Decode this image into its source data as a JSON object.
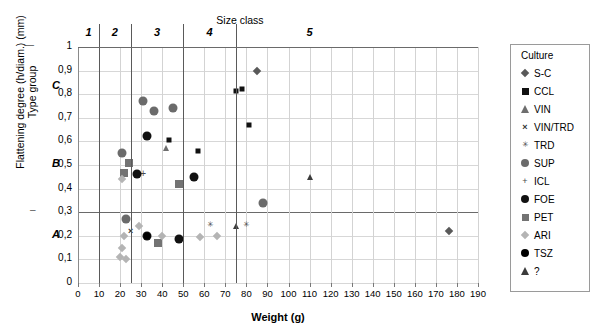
{
  "chart_data": {
    "type": "scatter",
    "title": "",
    "xlabel": "Weight (g)",
    "ylabel_line1": "Flattening degree (h/diam.) (mm)",
    "ylabel_line2": "Type group",
    "top_axis_label": "Size class",
    "xlim": [
      0,
      190
    ],
    "ylim": [
      0,
      1
    ],
    "xticks": [
      0,
      10,
      20,
      30,
      40,
      50,
      60,
      70,
      80,
      90,
      100,
      110,
      120,
      130,
      140,
      150,
      160,
      170,
      180,
      190
    ],
    "xtick_labels": [
      "0",
      "10",
      "20",
      "30",
      "40",
      "50",
      "60",
      "70",
      "80",
      "90",
      "100",
      "110",
      "120",
      "130",
      "140",
      "150",
      "160",
      "170",
      "180",
      "190"
    ],
    "yticks": [
      0,
      0.1,
      0.2,
      0.3,
      0.4,
      0.5,
      0.6,
      0.7,
      0.8,
      0.9,
      1
    ],
    "ytick_labels": [
      "0",
      "0,1",
      "0,2",
      "0,3",
      "0,4",
      "0,5",
      "0,6",
      "0,7",
      "0,8",
      "0,9",
      "1"
    ],
    "grid": true,
    "legend_position": "right",
    "legend_title": "Culture",
    "size_classes": [
      {
        "label": "1",
        "x_center": 5
      },
      {
        "label": "2",
        "x_center": 17.5
      },
      {
        "label": "3",
        "x_center": 37.5
      },
      {
        "label": "4",
        "x_center": 62.5
      },
      {
        "label": "5",
        "x_center": 110
      }
    ],
    "size_class_dividers": [
      10,
      25,
      50,
      75
    ],
    "type_group_boundaries": [
      0.3,
      0.65
    ],
    "type_groups": [
      {
        "label": "A",
        "y": 0.2
      },
      {
        "label": "B",
        "y": 0.5
      },
      {
        "label": "C",
        "y": 0.83
      }
    ],
    "series": [
      {
        "name": "S-C",
        "marker": "diamond",
        "color": "#595959",
        "size": 6,
        "points": [
          [
            85,
            0.9
          ],
          [
            176,
            0.22
          ]
        ]
      },
      {
        "name": "CCL",
        "marker": "square",
        "color": "#111111",
        "size": 5,
        "points": [
          [
            75,
            0.815
          ],
          [
            78,
            0.82
          ],
          [
            81,
            0.67
          ],
          [
            43,
            0.605
          ],
          [
            57,
            0.56
          ]
        ]
      },
      {
        "name": "VIN",
        "marker": "triangle",
        "color": "#6e6e6e",
        "size": 7,
        "points": [
          [
            42,
            0.57
          ]
        ]
      },
      {
        "name": "VIN/TRD",
        "marker": "x",
        "color": "#333333",
        "size": 9,
        "points": [
          [
            25,
            0.22
          ]
        ]
      },
      {
        "name": "TRD",
        "marker": "star",
        "color": "#4a4a4a",
        "size": 9,
        "points": [
          [
            63,
            0.25
          ],
          [
            80,
            0.25
          ]
        ]
      },
      {
        "name": "SUP",
        "marker": "circle",
        "color": "#6b6b6b",
        "size": 9,
        "points": [
          [
            31,
            0.77
          ],
          [
            36,
            0.73
          ],
          [
            45,
            0.74
          ],
          [
            21,
            0.55
          ],
          [
            23,
            0.27
          ],
          [
            88,
            0.34
          ]
        ]
      },
      {
        "name": "ICL",
        "marker": "plus",
        "color": "#4a4a4a",
        "size": 10,
        "points": [
          [
            31,
            0.46
          ]
        ]
      },
      {
        "name": "FOE",
        "marker": "circle",
        "color": "#111111",
        "size": 9,
        "points": [
          [
            33,
            0.625
          ],
          [
            28,
            0.46
          ],
          [
            55,
            0.45
          ],
          [
            48,
            0.185
          ],
          [
            33,
            0.2
          ]
        ]
      },
      {
        "name": "PET",
        "marker": "square",
        "color": "#737373",
        "size": 8,
        "points": [
          [
            24,
            0.51
          ],
          [
            22,
            0.465
          ],
          [
            48,
            0.42
          ],
          [
            38,
            0.17
          ]
        ]
      },
      {
        "name": "ARI",
        "marker": "diamond",
        "color": "#b4b4b4",
        "size": 6,
        "points": [
          [
            21,
            0.44
          ],
          [
            22,
            0.2
          ],
          [
            29,
            0.24
          ],
          [
            21,
            0.15
          ],
          [
            20,
            0.11
          ],
          [
            23,
            0.1
          ],
          [
            40,
            0.2
          ],
          [
            66,
            0.2
          ],
          [
            58,
            0.195
          ]
        ]
      },
      {
        "name": "TSZ",
        "marker": "circle",
        "color": "#000000",
        "size": 7,
        "points": [
          [
            33,
            0.2
          ]
        ]
      },
      {
        "name": "?",
        "marker": "triangle",
        "color": "#3b3b3b",
        "size": 7,
        "points": [
          [
            110,
            0.45
          ],
          [
            75,
            0.24
          ]
        ]
      }
    ]
  },
  "legend": {
    "title": "Culture",
    "items": [
      {
        "label": "S-C",
        "marker": "diamond",
        "color": "#595959"
      },
      {
        "label": "CCL",
        "marker": "square",
        "color": "#111111"
      },
      {
        "label": "VIN",
        "marker": "triangle",
        "color": "#6e6e6e"
      },
      {
        "label": "VIN/TRD",
        "marker": "x",
        "color": "#333333"
      },
      {
        "label": "TRD",
        "marker": "star",
        "color": "#4a4a4a"
      },
      {
        "label": "SUP",
        "marker": "circle",
        "color": "#6b6b6b"
      },
      {
        "label": "ICL",
        "marker": "plus",
        "color": "#4a4a4a"
      },
      {
        "label": "FOE",
        "marker": "circle",
        "color": "#111111"
      },
      {
        "label": "PET",
        "marker": "square",
        "color": "#737373"
      },
      {
        "label": "ARI",
        "marker": "diamond",
        "color": "#b4b4b4"
      },
      {
        "label": "TSZ",
        "marker": "circle",
        "color": "#000000"
      },
      {
        "label": "?",
        "marker": "triangle",
        "color": "#3b3b3b"
      }
    ]
  }
}
